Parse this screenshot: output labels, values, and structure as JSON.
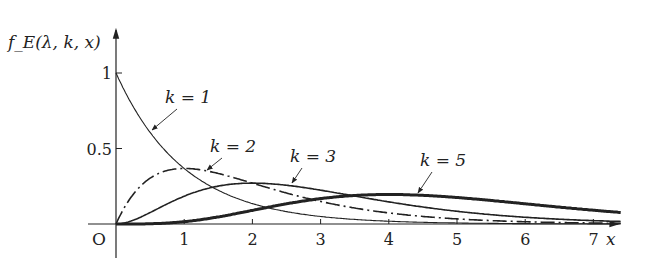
{
  "chart_data": {
    "type": "line",
    "title": "",
    "ylabel": "f_E(λ, k, x)",
    "xlabel": "x",
    "origin_label": "O",
    "lambda": 1,
    "xlim": [
      0,
      7.4
    ],
    "ylim": [
      0,
      1.1
    ],
    "x_ticks": [
      "1",
      "2",
      "3",
      "4",
      "5",
      "6",
      "7"
    ],
    "y_ticks": [
      "0.5",
      "1"
    ],
    "grid": false,
    "series": [
      {
        "name": "k = 1",
        "k": 1,
        "style": "thin-solid",
        "x": [
          0,
          0.5,
          1,
          1.5,
          2,
          3,
          4,
          5,
          6,
          7
        ],
        "values": [
          1.0,
          0.607,
          0.368,
          0.223,
          0.135,
          0.05,
          0.018,
          0.007,
          0.002,
          0.001
        ]
      },
      {
        "name": "k = 2",
        "k": 2,
        "style": "dash-dot",
        "x": [
          0,
          0.5,
          1,
          1.5,
          2,
          3,
          4,
          5,
          6,
          7
        ],
        "values": [
          0,
          0.303,
          0.368,
          0.335,
          0.271,
          0.149,
          0.073,
          0.034,
          0.015,
          0.006
        ]
      },
      {
        "name": "k = 3",
        "k": 3,
        "style": "medium-solid",
        "x": [
          0,
          0.5,
          1,
          1.5,
          2,
          3,
          4,
          5,
          6,
          7
        ],
        "values": [
          0,
          0.076,
          0.184,
          0.251,
          0.271,
          0.224,
          0.147,
          0.084,
          0.045,
          0.022
        ]
      },
      {
        "name": "k = 5",
        "k": 5,
        "style": "thick-solid",
        "x": [
          0,
          0.5,
          1,
          1.5,
          2,
          3,
          4,
          5,
          6,
          7
        ],
        "values": [
          0,
          0.002,
          0.015,
          0.047,
          0.09,
          0.168,
          0.195,
          0.175,
          0.134,
          0.091
        ]
      }
    ],
    "annotations": [
      {
        "label": "k = 1",
        "text_x": 165,
        "text_y": 103,
        "arrow_to": [
          152,
          130
        ]
      },
      {
        "label": "k = 2",
        "text_x": 210,
        "text_y": 152,
        "arrow_to": [
          207,
          170
        ]
      },
      {
        "label": "k = 3",
        "text_x": 290,
        "text_y": 162,
        "arrow_to": [
          292,
          183
        ]
      },
      {
        "label": "k = 5",
        "text_x": 420,
        "text_y": 166,
        "arrow_to": [
          418,
          193
        ]
      }
    ]
  }
}
